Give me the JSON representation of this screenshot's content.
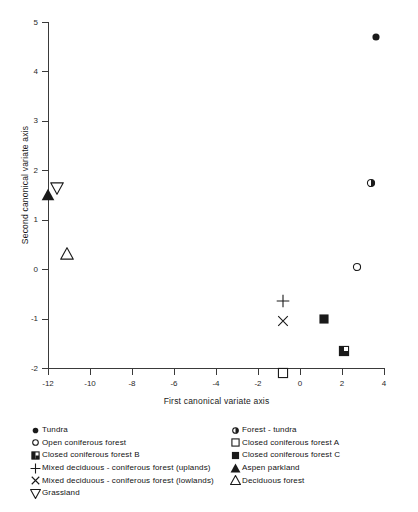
{
  "chart_data": {
    "type": "scatter",
    "title": "",
    "xlabel": "First canonical variate axis",
    "ylabel": "Second canonical variate axis",
    "xlim": [
      -12,
      4
    ],
    "ylim": [
      -2,
      5
    ],
    "xticks": [
      "-12",
      "-10",
      "-8",
      "-6",
      "-4",
      "-2",
      "0",
      "2",
      "4"
    ],
    "xtick_values": [
      -12,
      -10,
      -8,
      -6,
      -4,
      -2,
      0,
      2,
      4
    ],
    "yticks": [
      "5",
      "4",
      "3",
      "2",
      "1",
      "0",
      "-1",
      "-2"
    ],
    "ytick_values": [
      5,
      4,
      3,
      2,
      1,
      0,
      -1,
      -2
    ],
    "grid": false,
    "legend_position": "below-plot",
    "points": [
      {
        "label": "Tundra",
        "marker": "filled-circle",
        "x": 3.6,
        "y": 4.7
      },
      {
        "label": "Forest - tundra",
        "marker": "half-filled-circle",
        "x": 3.4,
        "y": 1.75
      },
      {
        "label": "Open coniferous forest",
        "marker": "open-circle",
        "x": 2.7,
        "y": 0.05
      },
      {
        "label": "Closed coniferous forest  A",
        "marker": "open-square",
        "x": -0.8,
        "y": -2.1
      },
      {
        "label": "Closed coniferous forest  B",
        "marker": "half-filled-square",
        "x": 2.1,
        "y": -1.65
      },
      {
        "label": "Closed coniferous forest  C",
        "marker": "filled-square",
        "x": 1.15,
        "y": -1.0
      },
      {
        "label": "Mixed deciduous - coniferous forest (uplands)",
        "marker": "plus",
        "x": -0.8,
        "y": -0.65
      },
      {
        "label": "Mixed deciduous - coniferous forest (lowlands)",
        "marker": "cross",
        "x": -0.8,
        "y": -1.05
      },
      {
        "label": "Aspen parkland",
        "marker": "filled-triangle-up",
        "x": -12.0,
        "y": 1.5
      },
      {
        "label": "Grassland",
        "marker": "open-triangle-down",
        "x": -11.55,
        "y": 1.65
      },
      {
        "label": "Deciduous forest",
        "marker": "open-triangle-up",
        "x": -11.1,
        "y": 0.3
      }
    ]
  },
  "legend": {
    "left_column": [
      {
        "marker": "filled-circle",
        "label": "Tundra"
      },
      {
        "marker": "open-circle",
        "label": "Open coniferous forest"
      },
      {
        "marker": "half-filled-square",
        "label": "Closed coniferous forest  B"
      },
      {
        "marker": "plus",
        "label": "Mixed deciduous - coniferous forest (uplands)"
      },
      {
        "marker": "cross",
        "label": "Mixed deciduous - coniferous forest (lowlands)"
      },
      {
        "marker": "open-triangle-down",
        "label": "Grassland"
      }
    ],
    "right_column": [
      {
        "marker": "half-filled-circle",
        "label": "Forest - tundra"
      },
      {
        "marker": "open-square",
        "label": "Closed coniferous forest  A"
      },
      {
        "marker": "filled-square",
        "label": "Closed coniferous forest  C"
      },
      {
        "marker": "filled-triangle-up",
        "label": "Aspen parkland"
      },
      {
        "marker": "open-triangle-up",
        "label": "Deciduous forest"
      }
    ]
  },
  "colors": {
    "ink": "#1a1a1a",
    "axis": "#3a3a3a",
    "background": "#ffffff"
  }
}
